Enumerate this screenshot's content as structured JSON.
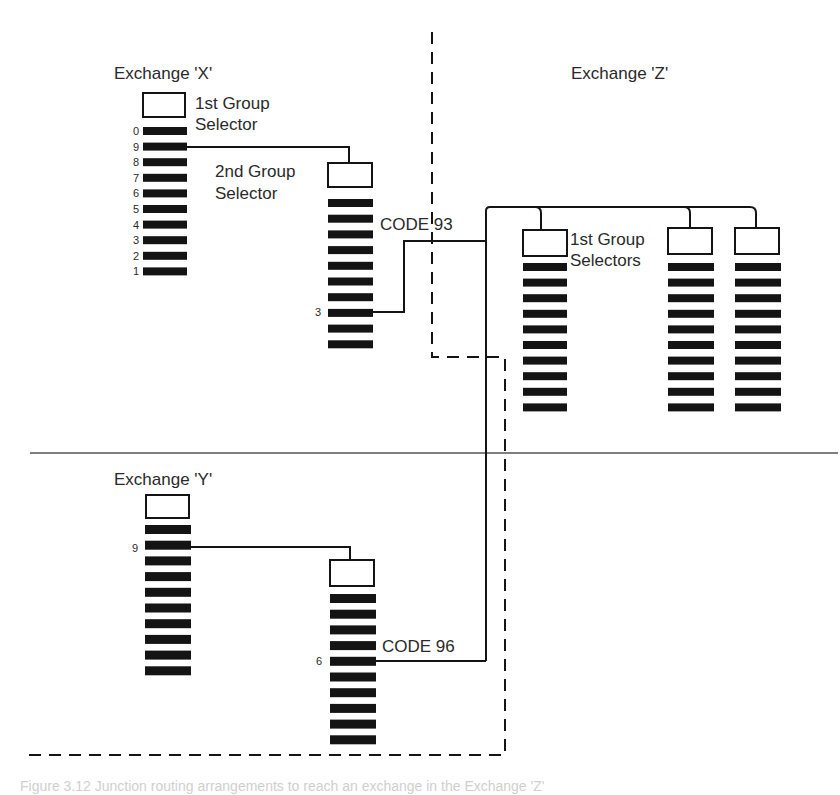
{
  "diagram": {
    "type": "telephone-exchange-trunking-diagram",
    "colors": {
      "ink": "#141414",
      "paper": "#ffffff",
      "text": "#2a2a2a"
    },
    "exchanges": [
      {
        "id": "X",
        "title": "Exchange 'X'"
      },
      {
        "id": "Y",
        "title": "Exchange 'Y'"
      },
      {
        "id": "Z",
        "title": "Exchange 'Z'"
      }
    ],
    "selectors": {
      "x_first": {
        "label_line1": "1st Group",
        "label_line2": "Selector",
        "outlet_numbers": [
          "0",
          "9",
          "8",
          "7",
          "6",
          "5",
          "4",
          "3",
          "2",
          "1"
        ],
        "connected_outlet": "9"
      },
      "x_second": {
        "label_line1": "2nd Group",
        "label_line2": "Selector",
        "outlet_count": 10,
        "connected_outlet": "3",
        "code": "CODE 93"
      },
      "y_first": {
        "outlet_count": 10,
        "connected_outlet": "9"
      },
      "y_second": {
        "outlet_count": 10,
        "connected_outlet": "6",
        "code": "CODE 96"
      },
      "z_first_group": {
        "label_line1": "1st Group",
        "label_line2": "Selectors",
        "selector_count": 3,
        "outlet_count": 10
      }
    },
    "caption": "Figure 3.12  Junction routing arrangements to reach an exchange in the Exchange 'Z'"
  }
}
